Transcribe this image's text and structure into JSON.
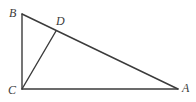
{
  "figure": {
    "name": "triangle-abc-with-cevian-cd",
    "type": "geometry-diagram",
    "background_color": "#ffffff",
    "stroke_color": "#3b3b3b",
    "stroke_width": 1.4,
    "canvas": {
      "width": 196,
      "height": 102
    },
    "points": {
      "A": {
        "label": "A",
        "x": 178,
        "y": 89,
        "label_x": 182,
        "label_y": 82
      },
      "B": {
        "label": "B",
        "x": 22,
        "y": 14,
        "label_x": 9,
        "label_y": 7
      },
      "C": {
        "label": "C",
        "x": 22,
        "y": 89,
        "label_x": 8,
        "label_y": 84
      },
      "D": {
        "label": "D",
        "x": 56,
        "y": 31,
        "label_x": 56,
        "label_y": 15
      }
    },
    "segments": [
      {
        "name": "segment-BC",
        "from": "B",
        "to": "C"
      },
      {
        "name": "segment-CA",
        "from": "C",
        "to": "A"
      },
      {
        "name": "segment-BA",
        "from": "B",
        "to": "A"
      },
      {
        "name": "segment-CD",
        "from": "C",
        "to": "D"
      }
    ]
  }
}
